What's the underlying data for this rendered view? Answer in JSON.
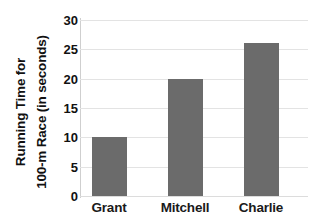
{
  "chart_data": {
    "type": "bar",
    "title": "",
    "subtitle": "",
    "categories": [
      "Grant",
      "Mitchell",
      "Charlie"
    ],
    "values": [
      10,
      20,
      26
    ],
    "xlabel": "",
    "ylabel_line1": "Running Time for",
    "ylabel_line2": "100-m Race (in seconds)",
    "ylabel": "Running Time for 100-m Race (in seconds)",
    "ylim": [
      0,
      30
    ],
    "ytick_values": [
      0,
      5,
      10,
      15,
      20,
      25,
      30
    ],
    "ytick_labels": [
      "0",
      "5",
      "10",
      "15",
      "20",
      "25",
      "30"
    ],
    "grid": "horizontal",
    "legend": "none",
    "bar_color": "#6b6b6b",
    "gridline_color": "#e3e3e3",
    "background_color": "#ffffff",
    "text_color": "#111111"
  }
}
